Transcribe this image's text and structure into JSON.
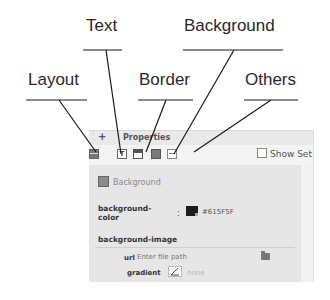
{
  "callouts": {
    "layout": "Layout",
    "text": "Text",
    "border": "Border",
    "background": "Background",
    "others": "Others"
  },
  "panel": {
    "header": {
      "expand_icon": "plus-icon",
      "title": "Properties"
    },
    "toolbar": {
      "icons": [
        {
          "name": "layout-icon",
          "label": "Layout"
        },
        {
          "name": "text-icon",
          "label": "Text",
          "glyph": "T"
        },
        {
          "name": "border-icon",
          "label": "Border"
        },
        {
          "name": "background-icon",
          "label": "Background"
        },
        {
          "name": "others-icon",
          "label": "Others"
        }
      ],
      "show_set_label": "Show Set",
      "show_set_checked": false
    },
    "section": {
      "title": "Background",
      "background_color_label_line1": "background-",
      "background_color_label_line2": "color",
      "colon": ":",
      "background_color_value": "#615F5F",
      "swatch_color": "#1c1c1c",
      "background_image_label": "background-image",
      "url_label": "url",
      "url_placeholder": "Enter file path",
      "url_value": "",
      "gradient_label": "gradient",
      "gradient_value": "none"
    }
  }
}
